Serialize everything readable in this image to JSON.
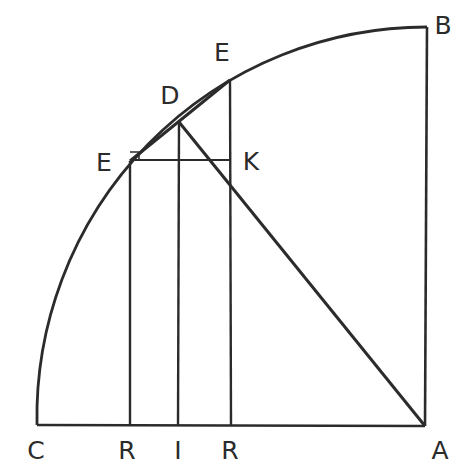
{
  "figure": {
    "background_color": "#ffffff",
    "stroke_color": "#2b2b2b",
    "canvas": {
      "width": 468,
      "height": 471
    },
    "labels": [
      {
        "id": "label-C",
        "text": "C",
        "x": 36,
        "y": 450,
        "name": "vertex-label-c"
      },
      {
        "id": "label-R1",
        "text": "R",
        "x": 127,
        "y": 450,
        "name": "vertex-label-r-left"
      },
      {
        "id": "label-I",
        "text": "I",
        "x": 178,
        "y": 450,
        "name": "vertex-label-i"
      },
      {
        "id": "label-R2",
        "text": "R",
        "x": 230,
        "y": 450,
        "name": "vertex-label-r-right"
      },
      {
        "id": "label-A",
        "text": "A",
        "x": 440,
        "y": 450,
        "name": "vertex-label-a"
      },
      {
        "id": "label-B",
        "text": "B",
        "x": 443,
        "y": 25,
        "name": "vertex-label-b"
      },
      {
        "id": "label-Eu",
        "text": "E",
        "x": 222,
        "y": 52,
        "name": "vertex-label-e-upper"
      },
      {
        "id": "label-D",
        "text": "D",
        "x": 170,
        "y": 95,
        "name": "vertex-label-d"
      },
      {
        "id": "label-El",
        "text": "E",
        "x": 104,
        "y": 162,
        "name": "vertex-label-e-lower"
      },
      {
        "id": "label-K",
        "text": "K",
        "x": 251,
        "y": 161,
        "name": "vertex-label-k"
      }
    ],
    "points": {
      "C": {
        "x": 37,
        "y": 425
      },
      "A": {
        "x": 425,
        "y": 426
      },
      "B": {
        "x": 427,
        "y": 27
      },
      "R1": {
        "x": 129,
        "y": 425
      },
      "I": {
        "x": 178,
        "y": 425
      },
      "R2": {
        "x": 231,
        "y": 425
      },
      "E_lower": {
        "x": 130,
        "y": 161
      },
      "D": {
        "x": 179,
        "y": 122
      },
      "E_upper": {
        "x": 230,
        "y": 80
      },
      "K": {
        "x": 231,
        "y": 160
      }
    },
    "arc": {
      "description": "quarter circle arc from C through E, D, E to B",
      "center_x": 425,
      "center_y": 426,
      "radius": 390,
      "path": "M 37 425 A 390 390 0 0 1 427 27"
    },
    "segments": [
      {
        "name": "baseline-C-A",
        "path": "M 37 425 L 425 426"
      },
      {
        "name": "right-edge-A-B",
        "path": "M 425 426 L 427 27"
      },
      {
        "name": "ordinate-R1-E-lower",
        "path": "M 130 425 L 130 161"
      },
      {
        "name": "ordinate-I-D",
        "path": "M 178 425 L 179 122"
      },
      {
        "name": "ordinate-R2-E-upper",
        "path": "M 231 425 L 230 80"
      },
      {
        "name": "chord-E-lower-to-E-upper",
        "path": "M 130 161 L 230 80"
      },
      {
        "name": "horizontal-E-lower-to-K",
        "path": "M 130 160 L 231 160"
      },
      {
        "name": "hypotenuse-D-to-A",
        "path": "M 179 122 L 425 426"
      },
      {
        "name": "right-angle-mark-E-lower",
        "path": "M 130 152 L 139 152 L 139 161"
      }
    ]
  }
}
